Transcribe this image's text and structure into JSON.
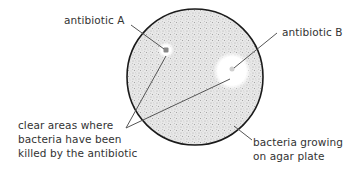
{
  "diagram": {
    "type": "labelled-diagram",
    "colors": {
      "background": "#ffffff",
      "plate_fill": "#e6e6e6",
      "plate_outline": "#1a1a1a",
      "leader_line": "#555555",
      "text": "#333333",
      "clear_zone": "#ffffff"
    },
    "labels": {
      "antibiotic_a": "antibiotic A",
      "antibiotic_b": "antibiotic B",
      "clear_areas": [
        "clear areas where",
        "bacteria have been",
        "killed by the antibiotic"
      ],
      "bacteria": [
        "bacteria growing",
        "on agar plate"
      ]
    },
    "elements": {
      "plate": {
        "cx": 195,
        "cy": 77,
        "r": 68
      },
      "zone_a": {
        "cx": 166,
        "cy": 50,
        "r": 7
      },
      "zone_b": {
        "cx": 232,
        "cy": 71,
        "r": 18
      }
    }
  }
}
